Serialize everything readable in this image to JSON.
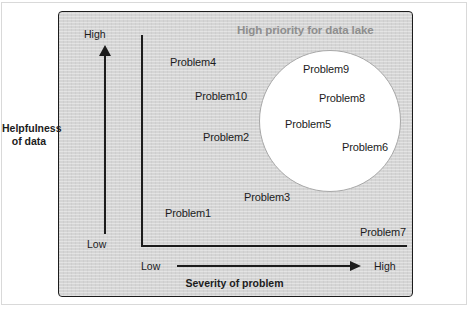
{
  "figure": {
    "callout_title": "High priority for data lake",
    "axes": {
      "y_title_line1": "Helpfulness",
      "y_title_line2": "of data",
      "y_tick_low": "Low",
      "y_tick_high": "High",
      "x_title": "Severity of problem",
      "x_tick_low": "Low",
      "x_tick_high": "High"
    },
    "colors": {
      "panel_background": "#d5d5d5",
      "panel_border": "#1c1c1c",
      "circle_fill": "#ffffff",
      "circle_border": "#a8a8a8",
      "callout_text": "#8e8e8e",
      "text": "#1c1c1c"
    }
  },
  "chart_data": {
    "type": "scatter",
    "title": "High priority for data lake",
    "xlabel": "Severity of problem",
    "ylabel": "Helpfulness of data",
    "xlim": [
      "Low",
      "High"
    ],
    "ylim": [
      "Low",
      "High"
    ],
    "grid": false,
    "legend": null,
    "annotations": [
      {
        "text": "High priority for data lake",
        "shape": "circle",
        "encloses": [
          "Problem9",
          "Problem8",
          "Problem5",
          "Problem6"
        ]
      }
    ],
    "points": [
      {
        "label": "Problem4",
        "severity": 0.18,
        "helpfulness": 0.92,
        "in_circle": false
      },
      {
        "label": "Problem10",
        "severity": 0.29,
        "helpfulness": 0.74,
        "in_circle": false
      },
      {
        "label": "Problem2",
        "severity": 0.31,
        "helpfulness": 0.53,
        "in_circle": false
      },
      {
        "label": "Problem1",
        "severity": 0.16,
        "helpfulness": 0.14,
        "in_circle": false
      },
      {
        "label": "Problem3",
        "severity": 0.47,
        "helpfulness": 0.22,
        "in_circle": false
      },
      {
        "label": "Problem7",
        "severity": 0.92,
        "helpfulness": 0.04,
        "in_circle": false
      },
      {
        "label": "Problem9",
        "severity": 0.7,
        "helpfulness": 0.88,
        "in_circle": true
      },
      {
        "label": "Problem8",
        "severity": 0.76,
        "helpfulness": 0.73,
        "in_circle": true
      },
      {
        "label": "Problem5",
        "severity": 0.63,
        "helpfulness": 0.6,
        "in_circle": true
      },
      {
        "label": "Problem6",
        "severity": 0.85,
        "helpfulness": 0.48,
        "in_circle": true
      }
    ]
  }
}
